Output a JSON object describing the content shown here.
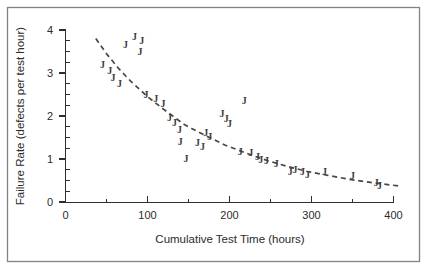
{
  "figure": {
    "background": "#ffffff",
    "frame_color": "#838383",
    "axis_color": "#2e2e2e"
  },
  "chart_data": {
    "type": "scatter",
    "title": "",
    "xlabel": "Cumulative Test Time (hours)",
    "ylabel": "Failure Rate (defects per test hour)",
    "xlim": [
      0,
      410
    ],
    "ylim": [
      0,
      4
    ],
    "x_major_ticks": [
      0,
      100,
      200,
      300,
      400
    ],
    "x_minor_ticks": [
      50,
      150,
      250,
      350
    ],
    "y_major_ticks": [
      0,
      1,
      2,
      3,
      4
    ],
    "y_minor_tick_step": 0.25,
    "grid": false,
    "legend": "none",
    "marker_glyph": "J",
    "marker_color": "#3d3d3d",
    "trend_color": "#474747",
    "series": [
      {
        "name": "observed failure rate",
        "marker": "J",
        "points": [
          [
            45,
            3.2
          ],
          [
            54,
            3.05
          ],
          [
            58,
            2.9
          ],
          [
            66,
            2.75
          ],
          [
            73,
            3.65
          ],
          [
            84,
            3.85
          ],
          [
            93,
            3.75
          ],
          [
            91,
            3.5
          ],
          [
            98,
            2.5
          ],
          [
            110,
            2.4
          ],
          [
            119,
            2.28
          ],
          [
            127,
            1.95
          ],
          [
            133,
            1.84
          ],
          [
            139,
            1.67
          ],
          [
            140,
            1.4
          ],
          [
            147,
            1.0
          ],
          [
            161,
            1.37
          ],
          [
            167,
            1.28
          ],
          [
            171,
            1.6
          ],
          [
            176,
            1.52
          ],
          [
            191,
            2.05
          ],
          [
            196,
            1.93
          ],
          [
            200,
            1.82
          ],
          [
            218,
            2.35
          ],
          [
            213,
            1.16
          ],
          [
            226,
            1.14
          ],
          [
            234,
            1.05
          ],
          [
            238,
            0.98
          ],
          [
            245,
            0.95
          ],
          [
            257,
            0.9
          ],
          [
            274,
            0.7
          ],
          [
            280,
            0.74
          ],
          [
            289,
            0.7
          ],
          [
            295,
            0.63
          ],
          [
            316,
            0.7
          ],
          [
            350,
            0.6
          ],
          [
            379,
            0.44
          ],
          [
            383,
            0.37
          ]
        ]
      }
    ],
    "trend_line": {
      "style": "dashed",
      "points": [
        [
          37,
          3.8
        ],
        [
          50,
          3.45
        ],
        [
          65,
          3.1
        ],
        [
          80,
          2.8
        ],
        [
          100,
          2.45
        ],
        [
          120,
          2.15
        ],
        [
          145,
          1.8
        ],
        [
          170,
          1.55
        ],
        [
          195,
          1.32
        ],
        [
          220,
          1.14
        ],
        [
          245,
          0.97
        ],
        [
          270,
          0.83
        ],
        [
          295,
          0.71
        ],
        [
          320,
          0.62
        ],
        [
          345,
          0.53
        ],
        [
          370,
          0.46
        ],
        [
          395,
          0.4
        ],
        [
          408,
          0.37
        ]
      ]
    }
  }
}
